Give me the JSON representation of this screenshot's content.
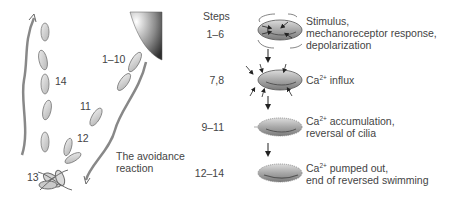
{
  "left_panel": {
    "labels": {
      "l1_10": "1–10",
      "l14": "14",
      "l11": "11",
      "l12": "12",
      "l13": "13"
    },
    "caption_line1": "The avoidance",
    "caption_line2": "reaction"
  },
  "right_panel": {
    "steps_header": "Steps",
    "stages": [
      {
        "steps": "1–6",
        "line1": "Stimulus,",
        "line2": "mechanoreceptor response,",
        "line3": "depolarization"
      },
      {
        "steps": "7,8",
        "ion": "Ca",
        "charge": "2+",
        "line1_rest": " influx"
      },
      {
        "steps": "9–11",
        "ion": "Ca",
        "charge": "2+",
        "line1_rest": " accumulation,",
        "line2": "reversal of cilia"
      },
      {
        "steps": "12–14",
        "ion": "Ca",
        "charge": "2+",
        "line1_rest": " pumped out,",
        "line2": "end of reversed swimming"
      }
    ]
  },
  "colors": {
    "cell_fill": "#c8c8c8",
    "cell_stroke": "#6a6a6a",
    "obstacle_dark": "#3a3a3a",
    "arrow": "#222222",
    "text": "#444444"
  }
}
